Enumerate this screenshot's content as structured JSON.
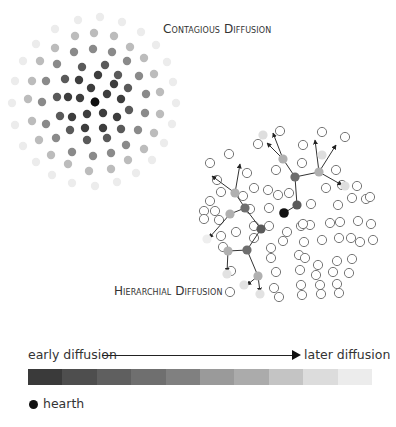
{
  "titles": {
    "contagious": "Contagious Diffusion",
    "hierarchical": "Hierarchial Diffusion"
  },
  "legend": {
    "early_label": "early diffusion",
    "later_label": "later diffusion",
    "hearth_label": "hearth",
    "hearth_color": "#111111",
    "scale_colors": [
      "#3a3a3a",
      "#4e4e4e",
      "#5f5f5f",
      "#6f6f6f",
      "#808080",
      "#9a9a9a",
      "#ababab",
      "#c4c4c4",
      "#dcdcdc",
      "#ececec"
    ]
  },
  "contagious": {
    "center": [
      95,
      102
    ],
    "rings": [
      {
        "color": "#111111",
        "points": [
          [
            95,
            102
          ]
        ]
      },
      {
        "color": "#3d3d3d",
        "points": [
          [
            91,
            88
          ],
          [
            107,
            94
          ],
          [
            80,
            98
          ],
          [
            103,
            113
          ],
          [
            87,
            114
          ],
          [
            98,
            75
          ],
          [
            114,
            84
          ],
          [
            121,
            99
          ],
          [
            117,
            117
          ],
          [
            103,
            128
          ],
          [
            85,
            128
          ],
          [
            72,
            117
          ],
          [
            68,
            97
          ],
          [
            79,
            80
          ]
        ]
      },
      {
        "color": "#5a5a5a",
        "points": [
          [
            82,
            67
          ],
          [
            105,
            65
          ],
          [
            118,
            75
          ],
          [
            128,
            88
          ],
          [
            129,
            110
          ],
          [
            121,
            129
          ],
          [
            107,
            138
          ],
          [
            87,
            140
          ],
          [
            70,
            130
          ],
          [
            60,
            116
          ],
          [
            57,
            97
          ],
          [
            65,
            79
          ]
        ]
      },
      {
        "color": "#8a8a8a",
        "points": [
          [
            74,
            52
          ],
          [
            93,
            49
          ],
          [
            112,
            52
          ],
          [
            127,
            61
          ],
          [
            139,
            76
          ],
          [
            146,
            94
          ],
          [
            145,
            113
          ],
          [
            138,
            130
          ],
          [
            126,
            145
          ],
          [
            111,
            153
          ],
          [
            93,
            156
          ],
          [
            72,
            152
          ],
          [
            56,
            138
          ],
          [
            46,
            124
          ],
          [
            42,
            102
          ],
          [
            46,
            81
          ],
          [
            57,
            64
          ]
        ]
      },
      {
        "color": "#bcbcbc",
        "points": [
          [
            75,
            36
          ],
          [
            94,
            33
          ],
          [
            114,
            36
          ],
          [
            130,
            47
          ],
          [
            144,
            58
          ],
          [
            154,
            74
          ],
          [
            160,
            92
          ],
          [
            160,
            114
          ],
          [
            154,
            133
          ],
          [
            144,
            149
          ],
          [
            128,
            160
          ],
          [
            111,
            169
          ],
          [
            89,
            171
          ],
          [
            68,
            164
          ],
          [
            51,
            155
          ],
          [
            39,
            140
          ],
          [
            32,
            121
          ],
          [
            28,
            99
          ],
          [
            32,
            81
          ],
          [
            40,
            61
          ],
          [
            55,
            48
          ]
        ]
      },
      {
        "color": "#ececec",
        "points": [
          [
            78,
            20
          ],
          [
            100,
            17
          ],
          [
            122,
            22
          ],
          [
            141,
            32
          ],
          [
            156,
            45
          ],
          [
            167,
            62
          ],
          [
            173,
            82
          ],
          [
            176,
            103
          ],
          [
            172,
            124
          ],
          [
            164,
            143
          ],
          [
            152,
            160
          ],
          [
            136,
            173
          ],
          [
            117,
            182
          ],
          [
            95,
            186
          ],
          [
            72,
            183
          ],
          [
            52,
            175
          ],
          [
            36,
            162
          ],
          [
            23,
            146
          ],
          [
            15,
            125
          ],
          [
            12,
            103
          ],
          [
            15,
            81
          ],
          [
            23,
            61
          ],
          [
            36,
            44
          ],
          [
            55,
            29
          ]
        ]
      }
    ]
  },
  "hierarchical": {
    "hearth": [
      284,
      213
    ],
    "edges": [
      [
        [
          284,
          213
        ],
        [
          297,
          205
        ]
      ],
      [
        [
          297,
          205
        ],
        [
          295,
          177
        ]
      ],
      [
        [
          295,
          177
        ],
        [
          283,
          159
        ]
      ],
      [
        [
          295,
          177
        ],
        [
          319,
          172
        ]
      ],
      [
        [
          319,
          172
        ],
        [
          342,
          185
        ]
      ],
      [
        [
          319,
          172
        ],
        [
          315,
          140
        ]
      ],
      [
        [
          283,
          159
        ],
        [
          267,
          143
        ]
      ],
      [
        [
          283,
          159
        ],
        [
          273,
          133
        ]
      ],
      [
        [
          319,
          172
        ],
        [
          336,
          145
        ]
      ],
      [
        [
          261,
          229
        ],
        [
          245,
          208
        ]
      ],
      [
        [
          245,
          208
        ],
        [
          235,
          193
        ]
      ],
      [
        [
          245,
          208
        ],
        [
          230,
          214
        ]
      ],
      [
        [
          235,
          193
        ],
        [
          212,
          176
        ]
      ],
      [
        [
          235,
          193
        ],
        [
          240,
          164
        ]
      ],
      [
        [
          230,
          214
        ],
        [
          209,
          238
        ]
      ],
      [
        [
          261,
          229
        ],
        [
          247,
          250
        ]
      ],
      [
        [
          247,
          250
        ],
        [
          228,
          251
        ]
      ],
      [
        [
          228,
          251
        ],
        [
          227,
          272
        ]
      ],
      [
        [
          247,
          250
        ],
        [
          258,
          276
        ]
      ],
      [
        [
          258,
          276
        ],
        [
          260,
          292
        ]
      ],
      [
        [
          258,
          276
        ],
        [
          247,
          285
        ]
      ]
    ],
    "arrowheads": [
      [
        267,
        143
      ],
      [
        273,
        133
      ],
      [
        315,
        140
      ],
      [
        342,
        185
      ],
      [
        212,
        176
      ],
      [
        240,
        164
      ],
      [
        209,
        238
      ],
      [
        227,
        272
      ],
      [
        260,
        292
      ],
      [
        247,
        285
      ],
      [
        336,
        145
      ]
    ],
    "nodes": [
      {
        "p": [
          297,
          205
        ],
        "c": "#5a5a5a"
      },
      {
        "p": [
          261,
          229
        ],
        "c": "#5a5a5a"
      },
      {
        "p": [
          295,
          177
        ],
        "c": "#6e6e6e"
      },
      {
        "p": [
          245,
          208
        ],
        "c": "#6e6e6e"
      },
      {
        "p": [
          247,
          250
        ],
        "c": "#6e6e6e"
      },
      {
        "p": [
          283,
          159
        ],
        "c": "#b0b0b0"
      },
      {
        "p": [
          319,
          172
        ],
        "c": "#b0b0b0"
      },
      {
        "p": [
          235,
          193
        ],
        "c": "#b0b0b0"
      },
      {
        "p": [
          230,
          214
        ],
        "c": "#b0b0b0"
      },
      {
        "p": [
          228,
          251
        ],
        "c": "#b0b0b0"
      },
      {
        "p": [
          258,
          276
        ],
        "c": "#b0b0b0"
      },
      {
        "p": [
          263,
          135
        ],
        "c": "#dedede"
      },
      {
        "p": [
          322,
          155
        ],
        "c": "#dedede"
      },
      {
        "p": [
          345,
          186
        ],
        "c": "#dedede"
      },
      {
        "p": [
          227,
          274
        ],
        "c": "#e2e2e2"
      },
      {
        "p": [
          244,
          285
        ],
        "c": "#e2e2e2"
      },
      {
        "p": [
          260,
          294
        ],
        "c": "#e2e2e2"
      },
      {
        "p": [
          207,
          239
        ],
        "c": "#eeeeee"
      }
    ],
    "open_circles": [
      [
        280,
        131
      ],
      [
        322,
        132
      ],
      [
        258,
        144
      ],
      [
        303,
        145
      ],
      [
        345,
        137
      ],
      [
        229,
        154
      ],
      [
        302,
        163
      ],
      [
        276,
        170
      ],
      [
        336,
        170
      ],
      [
        210,
        163
      ],
      [
        247,
        173
      ],
      [
        342,
        185
      ],
      [
        254,
        188
      ],
      [
        268,
        190
      ],
      [
        217,
        180
      ],
      [
        221,
        192
      ],
      [
        210,
        201
      ],
      [
        243,
        196
      ],
      [
        278,
        195
      ],
      [
        289,
        193
      ],
      [
        326,
        188
      ],
      [
        357,
        186
      ],
      [
        204,
        211
      ],
      [
        215,
        211
      ],
      [
        250,
        209
      ],
      [
        269,
        208
      ],
      [
        311,
        204
      ],
      [
        338,
        205
      ],
      [
        352,
        198
      ],
      [
        366,
        199
      ],
      [
        370,
        197
      ],
      [
        219,
        220
      ],
      [
        204,
        219
      ],
      [
        221,
        236
      ],
      [
        269,
        226
      ],
      [
        301,
        226
      ],
      [
        310,
        225
      ],
      [
        330,
        223
      ],
      [
        340,
        222
      ],
      [
        358,
        221
      ],
      [
        371,
        224
      ],
      [
        236,
        232
      ],
      [
        254,
        238
      ],
      [
        254,
        226
      ],
      [
        287,
        232
      ],
      [
        303,
        224
      ],
      [
        223,
        247
      ],
      [
        271,
        248
      ],
      [
        283,
        241
      ],
      [
        304,
        242
      ],
      [
        322,
        240
      ],
      [
        339,
        238
      ],
      [
        351,
        238
      ],
      [
        360,
        242
      ],
      [
        373,
        240
      ],
      [
        271,
        258
      ],
      [
        299,
        255
      ],
      [
        305,
        258
      ],
      [
        318,
        265
      ],
      [
        337,
        261
      ],
      [
        352,
        259
      ],
      [
        231,
        271
      ],
      [
        276,
        272
      ],
      [
        300,
        270
      ],
      [
        316,
        275
      ],
      [
        333,
        272
      ],
      [
        349,
        273
      ],
      [
        274,
        288
      ],
      [
        301,
        285
      ],
      [
        320,
        285
      ],
      [
        337,
        284
      ],
      [
        230,
        292
      ],
      [
        279,
        297
      ],
      [
        302,
        295
      ],
      [
        321,
        294
      ],
      [
        339,
        293
      ]
    ]
  }
}
